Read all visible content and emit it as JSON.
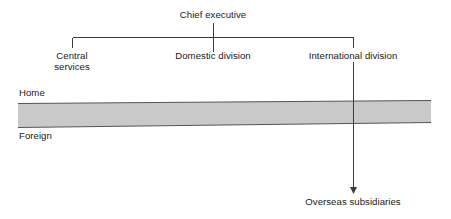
{
  "diagram": {
    "type": "organizational-chart",
    "nodes": {
      "chief_executive": "Chief executive",
      "central_services": "Central\nservices",
      "domestic_division": "Domestic division",
      "international_division": "International division",
      "overseas_subsidiaries": "Overseas subsidiaries"
    },
    "axis": {
      "home": "Home",
      "foreign": "Foreign"
    },
    "colors": {
      "band_fill": "#c9c9c9",
      "band_stroke": "#555555",
      "line": "#3c3c3c",
      "text": "#1a1a1a",
      "background": "#ffffff"
    }
  }
}
